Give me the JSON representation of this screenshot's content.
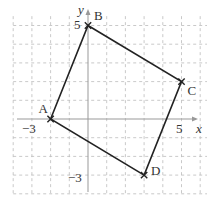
{
  "diagram": {
    "type": "coordinate-plane-quadrilateral",
    "axes": {
      "x_label": "x",
      "y_label": "y",
      "x_range": [
        -4,
        6
      ],
      "y_range": [
        -4,
        5
      ],
      "tick_labels": {
        "x_neg": "−3",
        "x_pos": "5",
        "y_pos": "5",
        "y_neg": "−3"
      }
    },
    "grid": {
      "style": "dashed",
      "color": "#bbbbbb"
    },
    "points": [
      {
        "name": "A",
        "x": -2,
        "y": 0
      },
      {
        "name": "B",
        "x": 0,
        "y": 5
      },
      {
        "name": "C",
        "x": 5,
        "y": 2
      },
      {
        "name": "D",
        "x": 3,
        "y": -3
      }
    ],
    "polygon": [
      "A",
      "B",
      "C",
      "D"
    ],
    "colors": {
      "line": "#222222",
      "axis": "#999999"
    }
  }
}
